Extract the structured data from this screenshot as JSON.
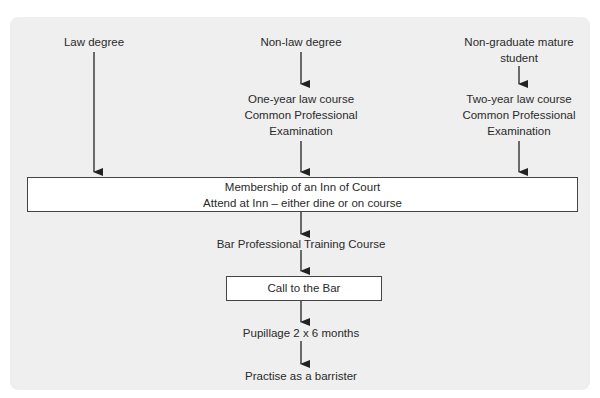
{
  "diagram": {
    "type": "flowchart",
    "entry_routes": [
      {
        "start": "Law degree",
        "course": []
      },
      {
        "start": "Non-law degree",
        "course": [
          "One-year law course",
          "Common Professional",
          "Examination"
        ]
      },
      {
        "start": [
          "Non-graduate mature",
          "student"
        ],
        "course": [
          "Two-year law course",
          "Common Professional",
          "Examination"
        ]
      }
    ],
    "inn_box": {
      "line1": "Membership of an Inn of Court",
      "line2": "Attend at Inn – either dine or on course"
    },
    "bptc": "Bar Professional Training Course",
    "call_box": "Call to the Bar",
    "pupillage": "Pupillage 2 x 6 months",
    "practise": "Practise as a barrister"
  }
}
